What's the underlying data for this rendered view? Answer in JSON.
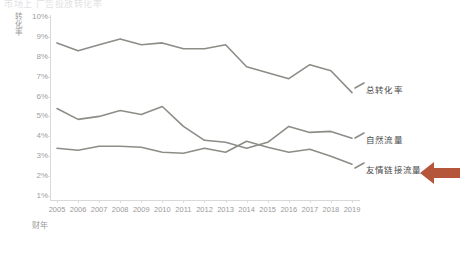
{
  "heading": "市场上 广告投放转化率",
  "caption": "",
  "axes": {
    "y_title": "转化率",
    "x_title": "财年",
    "y_ticks": [
      "10%",
      "9%",
      "8%",
      "7%",
      "6%",
      "5%",
      "4%",
      "3%",
      "2%",
      "1%"
    ],
    "y_min": 1,
    "y_max": 10,
    "x_ticks": [
      "2005",
      "2006",
      "2007",
      "2008",
      "2009",
      "2010",
      "2011",
      "2012",
      "2013",
      "2014",
      "2015",
      "2016",
      "2017",
      "2018",
      "2019"
    ]
  },
  "series_labels": {
    "total": "总转化率",
    "organic": "自然流量",
    "referral": "友情链接流量"
  },
  "annotation": {
    "arrow_name": "left-arrow-icon",
    "arrow_color": "#b5563a",
    "points_at": "友情链接流量"
  },
  "colors": {
    "line": "#8d8d87",
    "axis": "#d9d9d9",
    "tick_text": "#9a9a9a",
    "label_text": "#4a4a4a",
    "arrow": "#b5563a"
  },
  "chart_data": {
    "type": "line",
    "title": "市场上 广告投放转化率",
    "xlabel": "财年",
    "ylabel": "转化率",
    "ylim": [
      1,
      10
    ],
    "grid": false,
    "legend_position": "right-inline",
    "x": [
      "2005",
      "2006",
      "2007",
      "2008",
      "2009",
      "2010",
      "2011",
      "2012",
      "2013",
      "2014",
      "2015",
      "2016",
      "2017",
      "2018",
      "2019"
    ],
    "series": [
      {
        "name": "总转化率",
        "color": "#8d8d87",
        "values": [
          8.7,
          8.3,
          8.6,
          8.9,
          8.6,
          8.7,
          8.4,
          8.4,
          8.6,
          7.5,
          7.2,
          6.9,
          7.6,
          7.3,
          6.2
        ]
      },
      {
        "name": "自然流量",
        "color": "#8d8d87",
        "values": [
          5.4,
          4.85,
          5.0,
          5.3,
          5.1,
          5.5,
          4.5,
          3.8,
          3.7,
          3.4,
          3.7,
          4.5,
          4.2,
          4.25,
          3.9
        ]
      },
      {
        "name": "友情链接流量",
        "color": "#8d8d87",
        "values": [
          3.4,
          3.3,
          3.5,
          3.5,
          3.45,
          3.2,
          3.15,
          3.4,
          3.2,
          3.75,
          3.45,
          3.2,
          3.35,
          3.0,
          2.6
        ]
      }
    ]
  }
}
